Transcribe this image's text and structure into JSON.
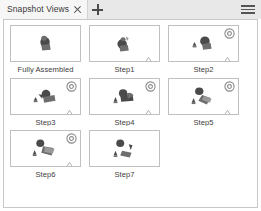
{
  "window": {
    "title": "Snapshot Views"
  },
  "tabbar": {
    "tab_label": "Snapshot Views",
    "close_icon": "close-icon",
    "add_icon": "plus-icon",
    "menu_icon": "hamburger-menu-icon"
  },
  "panel": {
    "rotate_icon": "rotate-icon",
    "marker_icon": "triangle-marker-icon",
    "snapshots": [
      {
        "label": "Fully Assembled",
        "has_rotate_badge": false,
        "has_triangle_marker": false,
        "model": "assembled"
      },
      {
        "label": "Step1",
        "has_rotate_badge": false,
        "has_triangle_marker": true,
        "model": "step1"
      },
      {
        "label": "Step2",
        "has_rotate_badge": true,
        "has_triangle_marker": true,
        "model": "step2"
      },
      {
        "label": "Step3",
        "has_rotate_badge": true,
        "has_triangle_marker": true,
        "model": "step3"
      },
      {
        "label": "Step4",
        "has_rotate_badge": true,
        "has_triangle_marker": true,
        "model": "step4"
      },
      {
        "label": "Step5",
        "has_rotate_badge": true,
        "has_triangle_marker": true,
        "model": "step5"
      },
      {
        "label": "Step6",
        "has_rotate_badge": true,
        "has_triangle_marker": true,
        "model": "step6"
      },
      {
        "label": "Step7",
        "has_rotate_badge": false,
        "has_triangle_marker": false,
        "model": "step7"
      }
    ]
  },
  "colors": {
    "tabbar_bg": "#e8e8e8",
    "tab_active_bg": "#f6f6f6",
    "panel_bg": "#ffffff",
    "panel_border": "#c8c8c8",
    "thumb_border": "#c0c0c0",
    "text": "#3d3d3d",
    "model_dark": "#4a4a4a",
    "model_mid": "#6e6e6e",
    "model_light": "#9a9a9a"
  }
}
